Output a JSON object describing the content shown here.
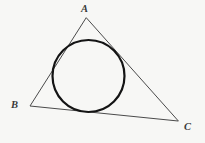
{
  "figure": {
    "background_color": "#f7f7f5",
    "canvas": {
      "width": 205,
      "height": 143
    },
    "labels": {
      "vertex_a": "A",
      "vertex_b": "B",
      "vertex_c": "C"
    },
    "triangle": {
      "name": "triangle-abc",
      "stroke_color": "#4a4a4a",
      "stroke_width": 1,
      "fill": "none",
      "vertices": {
        "A": {
          "x": 86,
          "y": 18
        },
        "B": {
          "x": 30,
          "y": 106
        },
        "C": {
          "x": 178,
          "y": 121
        }
      },
      "points_attr": "86,18 30,106 178,121",
      "label_positions": {
        "A": {
          "x": 85,
          "y": 9
        },
        "B": {
          "x": 16,
          "y": 107
        },
        "C": {
          "x": 188,
          "y": 129
        }
      }
    },
    "incircle": {
      "name": "inscribed-circle",
      "stroke_color": "#141414",
      "stroke_width": 2.2,
      "fill": "none",
      "center": {
        "x": 88.5,
        "y": 76
      },
      "radius": 36
    }
  }
}
